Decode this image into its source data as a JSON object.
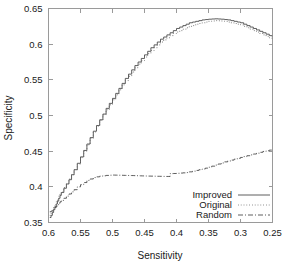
{
  "chart_data": {
    "type": "line",
    "title": "",
    "xlabel": "Sensitivity",
    "ylabel": "Specificity",
    "xlim": [
      0.6,
      0.25
    ],
    "ylim": [
      0.35,
      0.65
    ],
    "x_reversed": true,
    "grid": false,
    "legend_position": "bottom-right-inside",
    "xticks": [
      "0.6",
      "0.55",
      "0.5",
      "0.45",
      "0.4",
      "0.35",
      "0.3",
      "0.25"
    ],
    "xtick_values": [
      0.6,
      0.55,
      0.5,
      0.45,
      0.4,
      0.35,
      0.3,
      0.25
    ],
    "yticks": [
      "0.35",
      "0.4",
      "0.45",
      "0.5",
      "0.55",
      "0.6",
      "0.65"
    ],
    "ytick_values": [
      0.35,
      0.4,
      0.45,
      0.5,
      0.55,
      0.6,
      0.65
    ],
    "series": [
      {
        "name": "Improved",
        "style": "solid",
        "color": "#4d4d4d",
        "x": [
          0.598,
          0.596,
          0.594,
          0.592,
          0.59,
          0.588,
          0.586,
          0.584,
          0.582,
          0.58,
          0.576,
          0.572,
          0.568,
          0.564,
          0.56,
          0.555,
          0.55,
          0.545,
          0.54,
          0.535,
          0.53,
          0.525,
          0.52,
          0.515,
          0.51,
          0.505,
          0.5,
          0.495,
          0.49,
          0.485,
          0.48,
          0.475,
          0.47,
          0.465,
          0.46,
          0.455,
          0.45,
          0.445,
          0.44,
          0.435,
          0.43,
          0.425,
          0.42,
          0.415,
          0.41,
          0.405,
          0.4,
          0.395,
          0.39,
          0.385,
          0.38,
          0.375,
          0.37,
          0.365,
          0.36,
          0.355,
          0.35,
          0.345,
          0.34,
          0.335,
          0.33,
          0.325,
          0.32,
          0.315,
          0.31,
          0.305,
          0.3,
          0.295,
          0.29,
          0.285,
          0.28,
          0.275,
          0.27,
          0.265,
          0.26,
          0.255,
          0.251
        ],
        "y": [
          0.357,
          0.36,
          0.364,
          0.368,
          0.372,
          0.376,
          0.38,
          0.384,
          0.388,
          0.392,
          0.398,
          0.404,
          0.41,
          0.417,
          0.424,
          0.433,
          0.442,
          0.451,
          0.46,
          0.469,
          0.478,
          0.486,
          0.494,
          0.502,
          0.51,
          0.517,
          0.524,
          0.531,
          0.538,
          0.545,
          0.552,
          0.558,
          0.564,
          0.57,
          0.575,
          0.58,
          0.585,
          0.59,
          0.595,
          0.599,
          0.603,
          0.607,
          0.61,
          0.613,
          0.616,
          0.619,
          0.622,
          0.624,
          0.626,
          0.628,
          0.63,
          0.631,
          0.632,
          0.633,
          0.634,
          0.6345,
          0.635,
          0.6353,
          0.6355,
          0.6353,
          0.635,
          0.6345,
          0.634,
          0.633,
          0.632,
          0.631,
          0.63,
          0.628,
          0.626,
          0.624,
          0.622,
          0.62,
          0.618,
          0.616,
          0.614,
          0.612,
          0.611
        ]
      },
      {
        "name": "Original",
        "style": "dotted",
        "color": "#6b6b6b",
        "x": [
          0.598,
          0.596,
          0.594,
          0.592,
          0.59,
          0.588,
          0.586,
          0.584,
          0.582,
          0.58,
          0.576,
          0.572,
          0.568,
          0.564,
          0.56,
          0.555,
          0.55,
          0.545,
          0.54,
          0.535,
          0.53,
          0.525,
          0.52,
          0.515,
          0.51,
          0.505,
          0.5,
          0.495,
          0.49,
          0.485,
          0.48,
          0.475,
          0.47,
          0.465,
          0.46,
          0.455,
          0.45,
          0.445,
          0.44,
          0.435,
          0.43,
          0.425,
          0.42,
          0.415,
          0.41,
          0.405,
          0.4,
          0.395,
          0.39,
          0.385,
          0.38,
          0.375,
          0.37,
          0.365,
          0.36,
          0.355,
          0.35,
          0.345,
          0.34,
          0.335,
          0.33,
          0.325,
          0.32,
          0.315,
          0.31,
          0.305,
          0.3,
          0.295,
          0.29,
          0.285,
          0.28,
          0.275,
          0.27,
          0.265,
          0.26,
          0.255,
          0.251
        ],
        "y": [
          0.36,
          0.363,
          0.367,
          0.371,
          0.375,
          0.379,
          0.383,
          0.387,
          0.39,
          0.393,
          0.399,
          0.405,
          0.411,
          0.417,
          0.424,
          0.432,
          0.441,
          0.45,
          0.459,
          0.468,
          0.477,
          0.485,
          0.493,
          0.501,
          0.508,
          0.515,
          0.522,
          0.529,
          0.536,
          0.543,
          0.549,
          0.555,
          0.561,
          0.567,
          0.572,
          0.577,
          0.582,
          0.587,
          0.591,
          0.595,
          0.599,
          0.603,
          0.606,
          0.609,
          0.612,
          0.615,
          0.617,
          0.619,
          0.621,
          0.623,
          0.625,
          0.626,
          0.628,
          0.629,
          0.63,
          0.631,
          0.632,
          0.6325,
          0.633,
          0.6328,
          0.6325,
          0.632,
          0.631,
          0.63,
          0.629,
          0.628,
          0.627,
          0.625,
          0.623,
          0.621,
          0.619,
          0.617,
          0.615,
          0.613,
          0.611,
          0.609,
          0.608
        ]
      },
      {
        "name": "Random",
        "style": "dashdot",
        "color": "#4d4d4d",
        "x": [
          0.598,
          0.596,
          0.594,
          0.592,
          0.59,
          0.588,
          0.586,
          0.584,
          0.582,
          0.58,
          0.576,
          0.572,
          0.568,
          0.564,
          0.56,
          0.555,
          0.55,
          0.545,
          0.54,
          0.535,
          0.53,
          0.525,
          0.52,
          0.515,
          0.51,
          0.505,
          0.5,
          0.49,
          0.48,
          0.47,
          0.46,
          0.45,
          0.44,
          0.43,
          0.42,
          0.412,
          0.41,
          0.405,
          0.4,
          0.395,
          0.39,
          0.385,
          0.38,
          0.375,
          0.37,
          0.365,
          0.36,
          0.355,
          0.35,
          0.345,
          0.34,
          0.335,
          0.33,
          0.325,
          0.32,
          0.315,
          0.31,
          0.305,
          0.3,
          0.295,
          0.29,
          0.285,
          0.28,
          0.275,
          0.27,
          0.265,
          0.26,
          0.255,
          0.251
        ],
        "y": [
          0.365,
          0.366,
          0.367,
          0.369,
          0.371,
          0.373,
          0.375,
          0.377,
          0.379,
          0.381,
          0.384,
          0.387,
          0.39,
          0.393,
          0.396,
          0.4,
          0.403,
          0.406,
          0.409,
          0.411,
          0.413,
          0.414,
          0.415,
          0.4155,
          0.416,
          0.4163,
          0.4165,
          0.4163,
          0.416,
          0.4158,
          0.4155,
          0.4152,
          0.415,
          0.4148,
          0.4146,
          0.4145,
          0.4185,
          0.4187,
          0.419,
          0.4193,
          0.4196,
          0.42,
          0.421,
          0.422,
          0.423,
          0.424,
          0.425,
          0.4262,
          0.4275,
          0.429,
          0.4305,
          0.432,
          0.4335,
          0.435,
          0.4363,
          0.4375,
          0.4388,
          0.44,
          0.4412,
          0.4424,
          0.4436,
          0.4448,
          0.446,
          0.4472,
          0.4484,
          0.4496,
          0.4505,
          0.4515,
          0.4525
        ]
      }
    ]
  },
  "legend": {
    "entries": [
      {
        "label": "Improved",
        "style": "solid"
      },
      {
        "label": "Original",
        "style": "dotted"
      },
      {
        "label": "Random",
        "style": "dashdot"
      }
    ]
  },
  "colors": {
    "axis": "#9a9a9a",
    "text": "#1a1a1a",
    "improved": "#4d4d4d",
    "original": "#6b6b6b",
    "random": "#4d4d4d",
    "background": "#ffffff"
  }
}
